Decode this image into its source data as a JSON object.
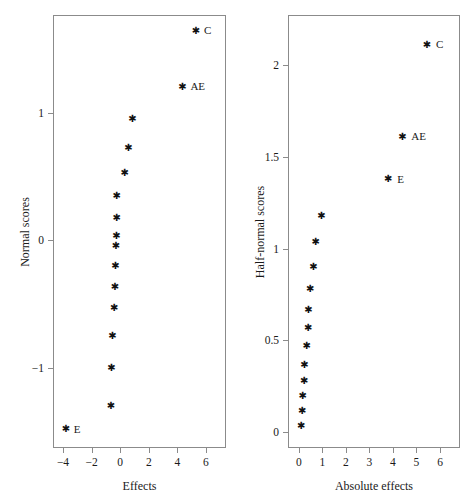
{
  "figure": {
    "background": "#ffffff",
    "marker_color": "#111111",
    "axis_color": "#8b8b8b",
    "text_color": "#1a1a1a"
  },
  "chart_data": [
    {
      "type": "scatter",
      "title": "",
      "xlabel": "Effects",
      "ylabel": "Normal scores",
      "xlim": [
        -4.7,
        7.4
      ],
      "ylim": [
        -1.63,
        1.77
      ],
      "grid": false,
      "legend": "none",
      "xticks": [
        -4,
        -2,
        0,
        2,
        4,
        6
      ],
      "xticklabels": [
        "-4",
        "-2",
        "0",
        "2",
        "4",
        "6"
      ],
      "yticks": [
        -1,
        0,
        1
      ],
      "yticklabels": [
        "-1",
        "0",
        "1"
      ],
      "points": [
        {
          "x": 5.3,
          "y": 1.65,
          "label": "C",
          "label_dx": 8,
          "label_dy": 0
        },
        {
          "x": 4.35,
          "y": 1.21,
          "label": "AE",
          "label_dx": 8,
          "label_dy": 0
        },
        {
          "x": 0.85,
          "y": 0.96,
          "label": "",
          "label_dx": 0,
          "label_dy": 0
        },
        {
          "x": 0.58,
          "y": 0.73,
          "label": "",
          "label_dx": 0,
          "label_dy": 0
        },
        {
          "x": 0.32,
          "y": 0.53,
          "label": "",
          "label_dx": 0,
          "label_dy": 0
        },
        {
          "x": -0.24,
          "y": 0.35,
          "label": "",
          "label_dx": 0,
          "label_dy": 0
        },
        {
          "x": -0.24,
          "y": 0.18,
          "label": "",
          "label_dx": 0,
          "label_dy": 0
        },
        {
          "x": -0.27,
          "y": 0.04,
          "label": "",
          "label_dx": 0,
          "label_dy": 0
        },
        {
          "x": -0.3,
          "y": -0.04,
          "label": "",
          "label_dx": 0,
          "label_dy": 0
        },
        {
          "x": -0.33,
          "y": -0.2,
          "label": "",
          "label_dx": 0,
          "label_dy": 0
        },
        {
          "x": -0.36,
          "y": -0.36,
          "label": "",
          "label_dx": 0,
          "label_dy": 0
        },
        {
          "x": -0.42,
          "y": -0.53,
          "label": "",
          "label_dx": 0,
          "label_dy": 0
        },
        {
          "x": -0.55,
          "y": -0.75,
          "label": "",
          "label_dx": 0,
          "label_dy": 0
        },
        {
          "x": -0.62,
          "y": -1.0,
          "label": "",
          "label_dx": 0,
          "label_dy": 0
        },
        {
          "x": -0.65,
          "y": -1.3,
          "label": "",
          "label_dx": 0,
          "label_dy": 0
        },
        {
          "x": -3.8,
          "y": -1.48,
          "label": "E",
          "label_dx": 8,
          "label_dy": 0
        }
      ]
    },
    {
      "type": "scatter",
      "title": "",
      "xlabel": "Absolute effects",
      "ylabel": "Half-normal scores",
      "xlim": [
        -0.46,
        6.85
      ],
      "ylim": [
        -0.085,
        2.27
      ],
      "grid": false,
      "legend": "none",
      "xticks": [
        0,
        1,
        2,
        3,
        4,
        5,
        6
      ],
      "xticklabels": [
        "0",
        "1",
        "2",
        "3",
        "4",
        "5",
        "6"
      ],
      "yticks": [
        0,
        0.5,
        1,
        1.5,
        2
      ],
      "yticklabels": [
        "0",
        "0.5",
        "1",
        "1.5",
        "2"
      ],
      "points": [
        {
          "x": 5.45,
          "y": 2.11,
          "label": "C",
          "label_dx": 9,
          "label_dy": 0
        },
        {
          "x": 4.4,
          "y": 1.61,
          "label": "AE",
          "label_dx": 9,
          "label_dy": 0
        },
        {
          "x": 3.8,
          "y": 1.38,
          "label": "E",
          "label_dx": 9,
          "label_dy": 0
        },
        {
          "x": 0.96,
          "y": 1.18,
          "label": "",
          "label_dx": 0,
          "label_dy": 0
        },
        {
          "x": 0.72,
          "y": 1.04,
          "label": "",
          "label_dx": 0,
          "label_dy": 0
        },
        {
          "x": 0.62,
          "y": 0.9,
          "label": "",
          "label_dx": 0,
          "label_dy": 0
        },
        {
          "x": 0.48,
          "y": 0.78,
          "label": "",
          "label_dx": 0,
          "label_dy": 0
        },
        {
          "x": 0.41,
          "y": 0.67,
          "label": "",
          "label_dx": 0,
          "label_dy": 0
        },
        {
          "x": 0.4,
          "y": 0.57,
          "label": "",
          "label_dx": 0,
          "label_dy": 0
        },
        {
          "x": 0.33,
          "y": 0.47,
          "label": "",
          "label_dx": 0,
          "label_dy": 0
        },
        {
          "x": 0.24,
          "y": 0.37,
          "label": "",
          "label_dx": 0,
          "label_dy": 0
        },
        {
          "x": 0.23,
          "y": 0.28,
          "label": "",
          "label_dx": 0,
          "label_dy": 0
        },
        {
          "x": 0.17,
          "y": 0.2,
          "label": "",
          "label_dx": 0,
          "label_dy": 0
        },
        {
          "x": 0.14,
          "y": 0.12,
          "label": "",
          "label_dx": 0,
          "label_dy": 0
        },
        {
          "x": 0.1,
          "y": 0.04,
          "label": "",
          "label_dx": 0,
          "label_dy": 0
        }
      ]
    }
  ]
}
